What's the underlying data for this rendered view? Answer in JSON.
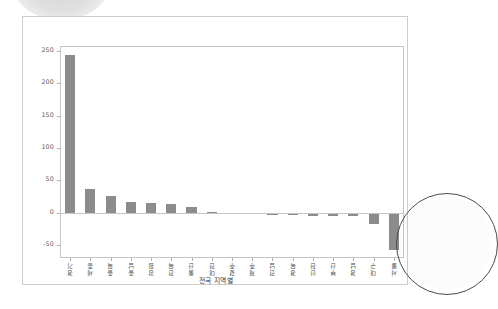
{
  "document": {
    "card_label": "chart-document-card"
  },
  "artifacts": {
    "top_left_label": "scan-shadow-arc",
    "right_label": "scan-circle-arc"
  },
  "chart_data": {
    "type": "bar",
    "title": "",
    "subtitle": "",
    "xlabel": "전국 지역별",
    "ylabel": "",
    "grid": false,
    "legend": false,
    "ylim": [
      -70,
      258
    ],
    "yticks": [
      250,
      200,
      150,
      100,
      50,
      0,
      -50
    ],
    "ytick_labels": [
      "250",
      "200",
      "150",
      "100",
      "50",
      "0",
      "-50"
    ],
    "bar_color": "#8c8c8c",
    "axis_color": "#c6c6c6",
    "categories": [
      "경기",
      "세종",
      "충북",
      "충남",
      "강원",
      "전북",
      "울산",
      "대전",
      "광주",
      "제주",
      "전남",
      "경북",
      "인천",
      "부산",
      "경남",
      "대구",
      "서울"
    ],
    "values": [
      244,
      37,
      26,
      16,
      15,
      14,
      9,
      0.4,
      -1.2,
      -2.2,
      -3.4,
      -3.6,
      -4.6,
      -5.2,
      -5.6,
      -17,
      -57
    ]
  }
}
